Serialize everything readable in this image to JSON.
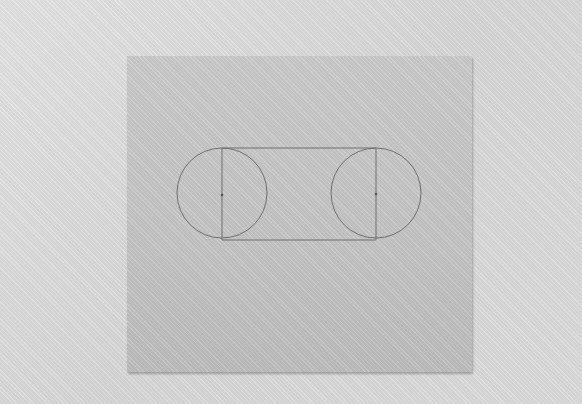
{
  "scene": {
    "description": "Photo of a gray sheet of paper on a lighter textured surface with a pencil drawing of two circles connected by tangent lines",
    "colors": {
      "background": "#dcdcdc",
      "paper": "#c4c4c4",
      "pencil": "#6a6a6a"
    }
  },
  "drawing": {
    "circles": [
      {
        "cx": 222,
        "cy": 193,
        "r": 45
      },
      {
        "cx": 376,
        "cy": 193,
        "r": 45
      }
    ],
    "top_line_y": 148,
    "bottom_line_y": 240
  }
}
